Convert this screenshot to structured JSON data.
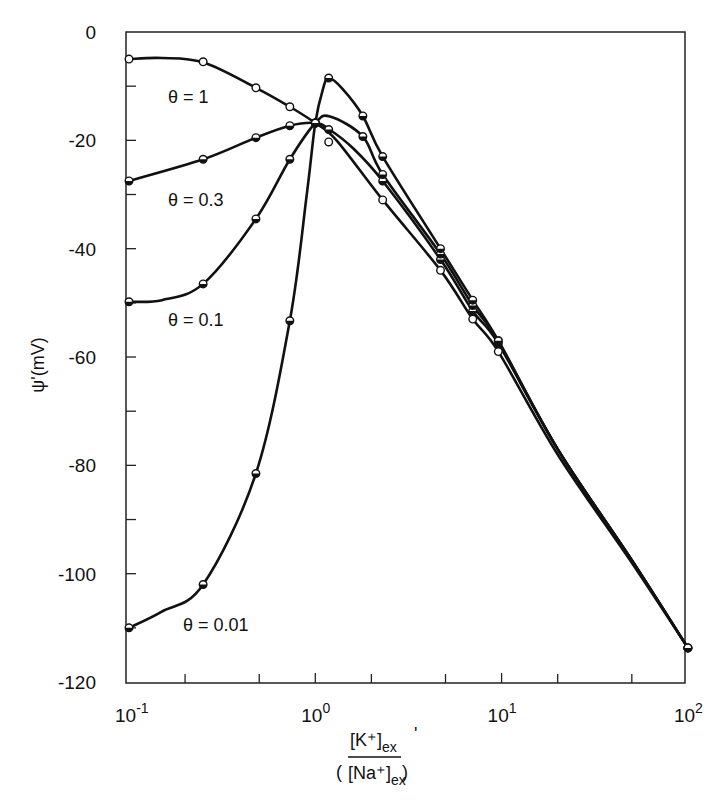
{
  "chart_data": {
    "type": "line",
    "title": "",
    "xlabel": "([K+]ex / [Na+]ex)'",
    "xlabel_parts": {
      "num": "[K⁺]",
      "num_sub": "ex",
      "den": "[Na⁺]",
      "den_sub": "ex",
      "prime": "'"
    },
    "ylabel": "ψ'(mV)",
    "xscale": "log",
    "xlim": [
      0.1,
      100
    ],
    "ylim": [
      -120,
      0
    ],
    "grid": false,
    "legend": "none (inline curve labels)",
    "x_ticks": [
      {
        "value": 0.1,
        "base": "10",
        "exp": "-1"
      },
      {
        "value": 1,
        "base": "10",
        "exp": "0"
      },
      {
        "value": 10,
        "base": "10",
        "exp": "1"
      },
      {
        "value": 100,
        "base": "10",
        "exp": "2"
      }
    ],
    "x_minor_ticks": [
      0.2,
      0.5,
      2,
      5,
      20,
      50
    ],
    "y_ticks": [
      0,
      -20,
      -40,
      -60,
      -80,
      -100,
      -120
    ],
    "y_tick_labels": [
      "0",
      "-20",
      "-40",
      "-60",
      "-80",
      "-100",
      "-120"
    ],
    "y_minor_ticks": [
      -10,
      -30,
      -50,
      -70,
      -90,
      -110
    ],
    "series": [
      {
        "name": "θ = 1",
        "label": "θ = 1",
        "marker": "open-circle",
        "label_pos": [
          168,
          103
        ],
        "x": [
          0.1,
          0.25,
          0.48,
          0.73,
          1.0,
          1.18,
          2.3,
          4.7,
          7.0,
          9.6,
          100
        ],
        "y": [
          -5,
          -5.5,
          -10.3,
          -13.8,
          -16.8,
          -20.3,
          -31,
          -44,
          -53,
          -59,
          -113.7
        ],
        "curve_x": [
          0.1,
          0.15,
          0.25,
          0.48,
          0.73,
          1.0,
          1.3,
          2.3,
          4.7,
          7.0,
          9.6,
          20,
          50,
          100
        ],
        "curve_y": [
          -5,
          -4.8,
          -5.6,
          -10.3,
          -13.8,
          -16.8,
          -20,
          -31,
          -44,
          -53,
          -59,
          -78,
          -98,
          -113.7
        ]
      },
      {
        "name": "θ = 0.3",
        "label": "θ = 0.3",
        "marker": "half-filled-circle",
        "label_pos": [
          168,
          206
        ],
        "x": [
          0.1,
          0.25,
          0.48,
          0.73,
          1.0,
          1.18,
          2.3,
          4.7,
          7.0,
          9.6,
          100
        ],
        "y": [
          -27.5,
          -23.5,
          -19.5,
          -17.3,
          -16.8,
          -18.0,
          -27.5,
          -42,
          -51.5,
          -57.5,
          -113.7
        ],
        "curve_x": [
          0.1,
          0.25,
          0.48,
          0.73,
          1.0,
          1.18,
          1.6,
          2.3,
          4.7,
          7.0,
          9.6,
          20,
          50,
          100
        ],
        "curve_y": [
          -27.5,
          -23.5,
          -19.5,
          -17.3,
          -16.8,
          -17.9,
          -21.5,
          -27.5,
          -42,
          -51.5,
          -57.5,
          -77,
          -97.5,
          -113.7
        ]
      },
      {
        "name": "θ = 0.1",
        "label": "θ = 0.1",
        "marker": "half-filled-circle",
        "label_pos": [
          168,
          326
        ],
        "x": [
          0.1,
          0.25,
          0.48,
          0.73,
          1.0,
          1.8,
          2.3,
          4.7,
          7.0,
          9.6,
          100
        ],
        "y": [
          -49.8,
          -46.5,
          -34.5,
          -23.5,
          -16.8,
          -19.3,
          -26.3,
          -41,
          -50.5,
          -57,
          -113.7
        ],
        "curve_x": [
          0.1,
          0.15,
          0.25,
          0.48,
          0.73,
          1.0,
          1.2,
          1.8,
          2.3,
          4.7,
          7.0,
          9.6,
          20,
          50,
          100
        ],
        "curve_y": [
          -49.8,
          -49.5,
          -46.5,
          -34.5,
          -23.5,
          -16.8,
          -15.6,
          -19.3,
          -26.3,
          -41,
          -50.5,
          -57,
          -77,
          -97.5,
          -113.7
        ]
      },
      {
        "name": "θ = 0.01",
        "label": "θ = 0.01",
        "marker": "half-filled-circle",
        "label_pos": [
          183,
          631
        ],
        "x": [
          0.1,
          0.25,
          0.48,
          0.73,
          1.0,
          1.18,
          1.8,
          2.3,
          4.7,
          7.0,
          9.6,
          100
        ],
        "y": [
          -110,
          -102,
          -81.5,
          -53.3,
          -16.8,
          -8.5,
          -15.5,
          -23,
          -40,
          -49.5,
          -57,
          -113.7
        ],
        "curve_x": [
          0.1,
          0.15,
          0.25,
          0.48,
          0.73,
          0.9,
          1.0,
          1.1,
          1.18,
          1.4,
          1.8,
          2.3,
          4.7,
          7.0,
          9.6,
          20,
          50,
          100
        ],
        "curve_y": [
          -110,
          -107,
          -102,
          -81.5,
          -53.3,
          -30,
          -16.8,
          -10.5,
          -8.5,
          -10.5,
          -15.5,
          -23,
          -40,
          -49.5,
          -57,
          -77,
          -97.5,
          -113.7
        ]
      }
    ]
  }
}
